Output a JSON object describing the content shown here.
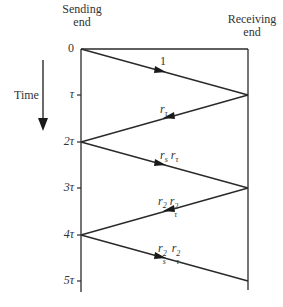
{
  "header": {
    "sending_end": [
      "Sending",
      "end"
    ],
    "receiving_end": [
      "Receiving",
      "end"
    ]
  },
  "time_axis": {
    "label": "Time",
    "ticks": [
      "0",
      "τ",
      "2τ",
      "3τ",
      "4τ",
      "5τ"
    ]
  },
  "waves": [
    {
      "label": "1",
      "direction": "forward"
    },
    {
      "label_base": [
        "r",
        "r"
      ],
      "label_sub": [
        "τ",
        ""
      ],
      "label": "r_τ",
      "direction": "backward"
    },
    {
      "label": "r_s r_τ",
      "direction": "forward"
    },
    {
      "label": "r_2 r_τ^2",
      "direction": "backward"
    },
    {
      "label": "r_s^2 r_τ^2",
      "direction": "forward"
    }
  ],
  "labels": {
    "w1": "1",
    "w2_r": "r",
    "w2_sub": "τ",
    "w3_r1": "r",
    "w3_sub1": "s",
    "w3_r2": "r",
    "w3_sub2": "τ",
    "w4_r1": "r",
    "w4_sub1": "2",
    "w4_r2": "r",
    "w4_sub2": "τ",
    "w4_sup2": "2",
    "w5_r1": "r",
    "w5_sub1": "s",
    "w5_sup1": "2",
    "w5_r2": "r",
    "w5_sub2": "τ",
    "w5_sup2": "2"
  },
  "colors": {
    "line": "#2a2a2a",
    "text": "#333333"
  }
}
